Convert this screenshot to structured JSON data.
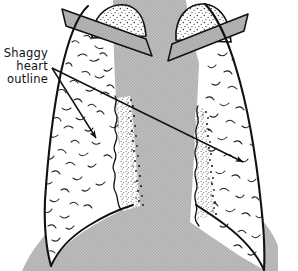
{
  "figure": {
    "name": "chest-radiograph-schematic",
    "background_color": "#ffffff",
    "ink_color": "#111111",
    "mediastinum_gray": "#b8b8b8",
    "clavicle_gray": "#b0b0b0",
    "stipple_gray": "#9a9a9a",
    "width": 298,
    "height": 271
  },
  "annotation": {
    "label_lines": [
      "Shaggy",
      "heart",
      "outline"
    ],
    "line1": "Shaggy",
    "line2": "heart",
    "line3": "outline",
    "leader_count": 2,
    "leader_origin": {
      "x": 52,
      "y": 68
    },
    "leader_targets": [
      {
        "x": 99,
        "y": 141,
        "target_name": "left-shaggy-border"
      },
      {
        "x": 246,
        "y": 164,
        "target_name": "right-shaggy-border"
      }
    ]
  },
  "anatomy": {
    "parts": [
      {
        "name": "left-lung-field",
        "fill": "#ffffff",
        "texture": "bronchovascular-squiggles"
      },
      {
        "name": "right-lung-field",
        "fill": "#ffffff",
        "texture": "bronchovascular-squiggles"
      },
      {
        "name": "left-lung-apex",
        "fill": "#ffffff",
        "texture": "dense-stipple"
      },
      {
        "name": "right-lung-apex",
        "fill": "#ffffff",
        "texture": "dense-stipple"
      },
      {
        "name": "left-clavicle",
        "fill": "#b0b0b0"
      },
      {
        "name": "right-clavicle",
        "fill": "#b0b0b0"
      },
      {
        "name": "mediastinum-heart-shadow",
        "fill": "#b8b8b8"
      },
      {
        "name": "diaphragm",
        "fill": "#b8b8b8"
      },
      {
        "name": "left-shaggy-border",
        "texture": "stipple-band-with-dark-fringe"
      },
      {
        "name": "right-shaggy-border",
        "texture": "stipple-band-with-dark-fringe"
      }
    ]
  }
}
